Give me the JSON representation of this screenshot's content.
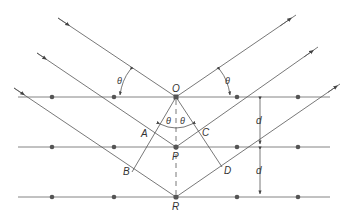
{
  "figure": {
    "points": {
      "O": "O",
      "P": "P",
      "R": "R",
      "A": "A",
      "B": "B",
      "C": "C",
      "D": "D"
    },
    "angle_label": "θ",
    "spacing_label": "d",
    "colors": {
      "line": "#555555",
      "atom": "#555555",
      "background": "#ffffff"
    },
    "planes": [
      {
        "name": "plane-1",
        "y": 97,
        "atoms_x": [
          52,
          114,
          176,
          237,
          298
        ]
      },
      {
        "name": "plane-2",
        "y": 147,
        "atoms_x": [
          52,
          114,
          176,
          237,
          298
        ]
      },
      {
        "name": "plane-3",
        "y": 197,
        "atoms_x": [
          52,
          114,
          176,
          237,
          298
        ]
      }
    ]
  }
}
